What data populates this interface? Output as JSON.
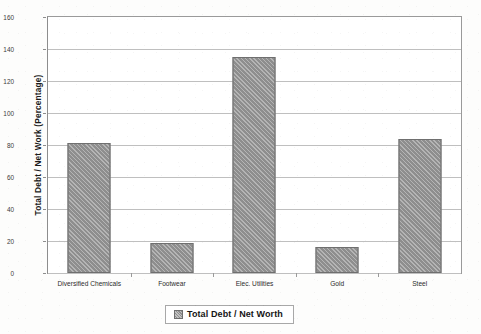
{
  "chart_data": {
    "type": "bar",
    "title": "",
    "subtitle": "",
    "xlabel": "",
    "ylabel": "Total Debt / Net Work (Percentage)",
    "categories": [
      "Diversified Chemicals",
      "Footwear",
      "Elec. Utilities",
      "Gold",
      "Steel"
    ],
    "values": [
      81,
      18.5,
      135,
      16.5,
      84
    ],
    "series": [
      {
        "name": "Total Debt / Net Worth",
        "values": [
          81,
          18.5,
          135,
          16.5,
          84
        ]
      }
    ],
    "ylim": [
      0,
      160
    ],
    "ytick_labels": [
      "0",
      "20",
      "40",
      "60",
      "80",
      "100",
      "120",
      "140",
      "160"
    ],
    "ytick_values": [
      0,
      20,
      40,
      60,
      80,
      100,
      120,
      140,
      160
    ],
    "grid": true,
    "grid_axis": "y",
    "legend": {
      "position": "bottom",
      "entries": [
        {
          "label": "Total Debt / Net Worth",
          "swatch_color": "#8e8e8e",
          "swatch_pattern": "diagonal-hatch"
        }
      ]
    },
    "colors": {
      "bar_fill": "#8e8e8e",
      "bar_border": "#6f6f6f",
      "gridline": "#bfbfbf",
      "plot_border": "#9a9a9a",
      "plot_background": "#ffffff",
      "page_background": "#fdfdfc",
      "text": "#1b1b1b"
    }
  }
}
